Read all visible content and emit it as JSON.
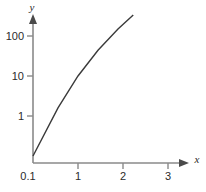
{
  "chart_data": {
    "type": "line",
    "title": "",
    "xlabel": "x",
    "ylabel": "y",
    "x_scale": "linear",
    "y_scale": "log",
    "xlim": [
      0.1,
      3.4
    ],
    "ylim": [
      0.1,
      320
    ],
    "grid": false,
    "legend": null,
    "x_ticks": [
      {
        "value": 0.1,
        "label": "0.1"
      },
      {
        "value": 1,
        "label": "1"
      },
      {
        "value": 2,
        "label": "2"
      },
      {
        "value": 3,
        "label": "3"
      }
    ],
    "y_ticks": [
      {
        "value": 1,
        "label": "1"
      },
      {
        "value": 10,
        "label": "10"
      },
      {
        "value": 100,
        "label": "100"
      }
    ],
    "series": [
      {
        "name": "line",
        "x": [
          0.1,
          0.6,
          1.0,
          1.4,
          1.8,
          2.3
        ],
        "y": [
          0.1,
          1.6,
          10.0,
          44.0,
          150.0,
          560.0
        ]
      }
    ],
    "annotations": []
  },
  "axes": {
    "x_name": "x",
    "y_name": "y"
  },
  "colors": {
    "axis": "#8a8a8a",
    "arrow": "#4a4a4a",
    "data_line": "#3a3a3a",
    "text": "#2b2b2b",
    "background": "#ffffff"
  }
}
